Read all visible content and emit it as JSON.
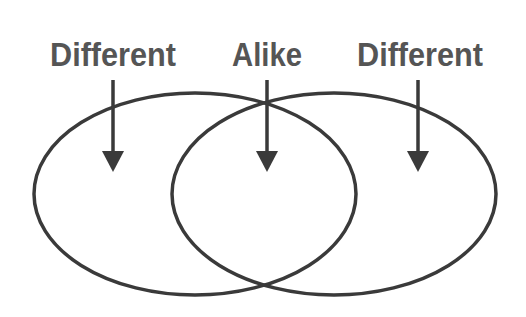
{
  "diagram": {
    "type": "venn",
    "labels": [
      {
        "id": "left",
        "text": "Different",
        "x": 113
      },
      {
        "id": "center",
        "text": "Alike",
        "x": 267
      },
      {
        "id": "right",
        "text": "Different",
        "x": 420
      }
    ],
    "sets": [
      {
        "id": "left-set",
        "region_label": "Different"
      },
      {
        "id": "right-set",
        "region_label": "Different"
      }
    ],
    "intersection_label": "Alike",
    "colors": {
      "stroke": "#3a3a3a",
      "text": "#555555",
      "background": "#ffffff"
    }
  }
}
